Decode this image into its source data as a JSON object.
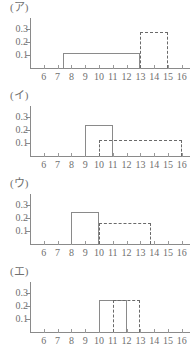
{
  "figure": {
    "title": "",
    "panel_count": 4
  },
  "chart_data": [
    {
      "type": "bar",
      "title": "(ア)",
      "xlabel": "",
      "ylabel": "",
      "xlim": [
        5.0,
        16.6
      ],
      "ylim": [
        0,
        0.345
      ],
      "grid": false,
      "legend": "none",
      "xticks": [
        6,
        7,
        8,
        9,
        10,
        11,
        12,
        13,
        14,
        15,
        16
      ],
      "xticklabels": [
        "6",
        "7",
        "8",
        "9",
        "10",
        "11",
        "12",
        "13",
        "14",
        "15",
        "16"
      ],
      "yticks": [
        0.1,
        0.2,
        0.3
      ],
      "yticklabels": [
        "0.1",
        "0.2",
        "0.3"
      ],
      "series": [
        {
          "name": "solid",
          "style": "solid",
          "x_start": 7.4,
          "x_end": 13.0,
          "height": 0.115
        },
        {
          "name": "dashed",
          "style": "dashed",
          "x_start": 13.0,
          "x_end": 15.0,
          "height": 0.28
        }
      ]
    },
    {
      "type": "bar",
      "title": "(イ)",
      "xlabel": "",
      "ylabel": "",
      "xlim": [
        5.0,
        16.6
      ],
      "ylim": [
        0,
        0.345
      ],
      "grid": false,
      "legend": "none",
      "xticks": [
        6,
        7,
        8,
        9,
        10,
        11,
        12,
        13,
        14,
        15,
        16
      ],
      "xticklabels": [
        "6",
        "7",
        "8",
        "9",
        "10",
        "11",
        "12",
        "13",
        "14",
        "15",
        "16"
      ],
      "yticks": [
        0.1,
        0.2,
        0.3
      ],
      "yticklabels": [
        "0.1",
        "0.2",
        "0.3"
      ],
      "series": [
        {
          "name": "solid",
          "style": "solid",
          "x_start": 9.0,
          "x_end": 11.0,
          "height": 0.24
        },
        {
          "name": "dashed",
          "style": "dashed",
          "x_start": 10.0,
          "x_end": 16.0,
          "height": 0.12
        }
      ]
    },
    {
      "type": "bar",
      "title": "(ウ)",
      "xlabel": "",
      "ylabel": "",
      "xlim": [
        5.0,
        16.6
      ],
      "ylim": [
        0,
        0.345
      ],
      "grid": false,
      "legend": "none",
      "xticks": [
        6,
        7,
        8,
        9,
        10,
        11,
        12,
        13,
        14,
        15,
        16
      ],
      "xticklabels": [
        "6",
        "7",
        "8",
        "9",
        "10",
        "11",
        "12",
        "13",
        "14",
        "15",
        "16"
      ],
      "yticks": [
        0.1,
        0.2,
        0.3
      ],
      "yticklabels": [
        "0.1",
        "0.2",
        "0.3"
      ],
      "series": [
        {
          "name": "solid",
          "style": "solid",
          "x_start": 8.0,
          "x_end": 10.0,
          "height": 0.25
        },
        {
          "name": "dashed",
          "style": "dashed",
          "x_start": 10.0,
          "x_end": 13.8,
          "height": 0.16
        }
      ]
    },
    {
      "type": "bar",
      "title": "(エ)",
      "xlabel": "",
      "ylabel": "",
      "xlim": [
        5.0,
        16.6
      ],
      "ylim": [
        0,
        0.345
      ],
      "grid": false,
      "legend": "none",
      "xticks": [
        6,
        7,
        8,
        9,
        10,
        11,
        12,
        13,
        14,
        15,
        16
      ],
      "xticklabels": [
        "6",
        "7",
        "8",
        "9",
        "10",
        "11",
        "12",
        "13",
        "14",
        "15",
        "16"
      ],
      "yticks": [
        0.1,
        0.2,
        0.3
      ],
      "yticklabels": [
        "0.1",
        "0.2",
        "0.3"
      ],
      "series": [
        {
          "name": "solid",
          "style": "solid",
          "x_start": 10.0,
          "x_end": 12.0,
          "height": 0.245
        },
        {
          "name": "dashed",
          "style": "dashed",
          "x_start": 11.0,
          "x_end": 13.0,
          "height": 0.245
        }
      ]
    }
  ],
  "style": {
    "line_color": "#8a8a8a",
    "dash_color": "#6a6a6a",
    "text_color": "#6f6f6f",
    "background": "#ffffff"
  }
}
